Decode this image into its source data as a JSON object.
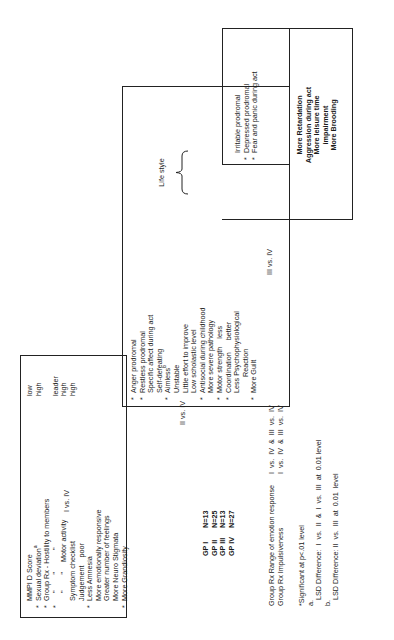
{
  "comparisons": {
    "i_vs_iv": "I vs. IV",
    "ii_vs_iv": "II vs. IV",
    "iii_vs_iv": "III vs. IV"
  },
  "box_i_vs_iv": {
    "items": [
      {
        "bullet": "",
        "text": "MMPI D Score",
        "value": "low"
      },
      {
        "bullet": "*",
        "text": "Sexual deviation",
        "sup": "a",
        "value": "high"
      },
      {
        "bullet": "*",
        "text": "Group Rx - Hostility to members",
        "value": ""
      },
      {
        "bullet": "*",
        "text": "    \"        \"           \"",
        "value": "leader"
      },
      {
        "bullet": "",
        "text": "    \"        \"     Motor activity",
        "value": "high"
      },
      {
        "bullet": "",
        "text": "Symptom checklist",
        "value": "high"
      },
      {
        "bullet": "",
        "text": "Judgement    poor",
        "value": ""
      },
      {
        "bullet": "*",
        "text": "Less Amnesia",
        "value": ""
      },
      {
        "bullet": "",
        "text": "More emotionally responsive",
        "value": ""
      },
      {
        "bullet": "",
        "text": "Greater number of feelings",
        "value": ""
      },
      {
        "bullet": "",
        "text": "More Neuro Stigmata",
        "value": ""
      },
      {
        "bullet": "*",
        "text": "More Grandiosity",
        "value": ""
      }
    ]
  },
  "box_ii_vs_iv": {
    "items": [
      {
        "bullet": "*",
        "text": "Anger prodromal"
      },
      {
        "bullet": "*",
        "text": "Restless prodromal"
      },
      {
        "bullet": "",
        "text": "Specific affect during act"
      },
      {
        "bullet": "",
        "text": "Self-defeating"
      },
      {
        "bullet": "*",
        "text": "Aimless",
        "sup": "b"
      },
      {
        "bullet": "",
        "text": "Unstable"
      },
      {
        "bullet": "",
        "text": "Little effort to improve"
      },
      {
        "bullet": "",
        "text": "Low scholastic level"
      },
      {
        "bullet": "*",
        "text": "Antisocial during childhood"
      },
      {
        "bullet": "",
        "text": "More severe pathology"
      },
      {
        "bullet": "*",
        "text": "Motor strength    less"
      },
      {
        "bullet": "*",
        "text": "Coordination      better"
      },
      {
        "bullet": "",
        "text": "Less Psychophysiological"
      },
      {
        "bullet": "",
        "text": "        Reaction"
      },
      {
        "bullet": "*",
        "text": "More Guilt"
      }
    ],
    "life_style_label": "Life style"
  },
  "box_iii_vs_iv_inner": {
    "items": [
      {
        "bullet": "",
        "text": "Irritable prodromal"
      },
      {
        "bullet": "*",
        "text": "Depressed prodromal"
      },
      {
        "bullet": "*",
        "text": "Fear and panic during act"
      }
    ]
  },
  "box_iii_vs_iv": {
    "items": [
      "More Retardation",
      "Aggression during act",
      "More leisure time",
      "impairment",
      "More Brooding"
    ]
  },
  "groups": [
    {
      "label": "GP I",
      "n": "N=13"
    },
    {
      "label": "GP II",
      "n": "N=25"
    },
    {
      "label": "GP III",
      "n": "N=13"
    },
    {
      "label": "GP IV",
      "n": "N=27"
    }
  ],
  "group_rx": [
    {
      "label": "Group Rx Range of emotion response",
      "cmp": "I  vs.  IV  &  III  vs.  IV"
    },
    {
      "label": "Group Rx Impulsiveness",
      "cmp": "I  vs.  IV  &  III  vs.  IV"
    }
  ],
  "footnotes": {
    "significance": "*Significant at p<.01 level",
    "a_marker": "a.",
    "a_text": "LSD Difference:  I  vs.  II  &  I  vs.  III  at  0.01 level",
    "b_marker": "b.",
    "b_text": "LSD Difference: II  vs.  III  at  0.01  level"
  }
}
